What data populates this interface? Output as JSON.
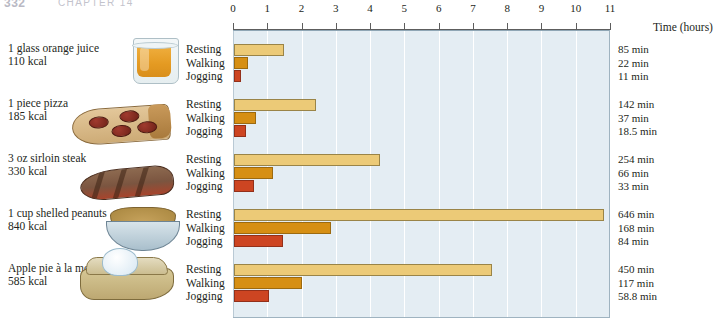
{
  "page_header": {
    "folio": "332",
    "running_head": "CHAPTER 14"
  },
  "chart_data": {
    "type": "bar",
    "orientation": "horizontal",
    "title": "",
    "xlabel": "Time (hours)",
    "ylabel": "",
    "xlim": [
      0,
      11
    ],
    "xticks": [
      0,
      1,
      2,
      3,
      4,
      5,
      6,
      7,
      8,
      9,
      10,
      11
    ],
    "xtick_labels": [
      "0",
      "1",
      "2",
      "3",
      "4",
      "5",
      "6",
      "7",
      "8",
      "9",
      "10",
      "11"
    ],
    "grid": true,
    "legend": "none",
    "value_unit": "min",
    "series": [
      {
        "name": "Resting",
        "color": "#ecca77",
        "values": [
          85,
          142,
          254,
          646,
          450
        ]
      },
      {
        "name": "Walking",
        "color": "#d68f14",
        "values": [
          22,
          37,
          66,
          168,
          117
        ]
      },
      {
        "name": "Jogging",
        "color": "#cd4522",
        "values": [
          11,
          18.5,
          33,
          84,
          58.8
        ]
      }
    ],
    "categories": [
      "1 glass orange juice",
      "1 piece pizza",
      "3 oz sirloin steak",
      "1 cup shelled peanuts",
      "Apple pie à la mode"
    ]
  },
  "axis": {
    "title": "Time (hours)",
    "ticks": [
      "0",
      "1",
      "2",
      "3",
      "4",
      "5",
      "6",
      "7",
      "8",
      "9",
      "10",
      "11"
    ]
  },
  "activities": [
    "Resting",
    "Walking",
    "Jogging"
  ],
  "rows": [
    {
      "food": "1 glass orange juice",
      "kcal": "110  kcal",
      "icon": "orange-juice-glass",
      "bars": [
        {
          "activity": "Resting",
          "minutes": 85,
          "label": "85 min",
          "hours": 1.4167
        },
        {
          "activity": "Walking",
          "minutes": 22,
          "label": "22 min",
          "hours": 0.3667
        },
        {
          "activity": "Jogging",
          "minutes": 11,
          "label": "11 min",
          "hours": 0.1833
        }
      ]
    },
    {
      "food": "1 piece pizza",
      "kcal": "185 kcal",
      "icon": "pizza-slice",
      "bars": [
        {
          "activity": "Resting",
          "minutes": 142,
          "label": "142 min",
          "hours": 2.3667
        },
        {
          "activity": "Walking",
          "minutes": 37,
          "label": "37 min",
          "hours": 0.6167
        },
        {
          "activity": "Jogging",
          "minutes": 18.5,
          "label": "18.5 min",
          "hours": 0.3083
        }
      ]
    },
    {
      "food": "3 oz sirloin steak",
      "kcal": "330 kcal",
      "icon": "steak",
      "bars": [
        {
          "activity": "Resting",
          "minutes": 254,
          "label": "254 min",
          "hours": 4.2333
        },
        {
          "activity": "Walking",
          "minutes": 66,
          "label": "66 min",
          "hours": 1.1
        },
        {
          "activity": "Jogging",
          "minutes": 33,
          "label": "33 min",
          "hours": 0.55
        }
      ]
    },
    {
      "food": "1 cup shelled peanuts",
      "kcal": "840 kcal",
      "icon": "peanut-bowl",
      "bars": [
        {
          "activity": "Resting",
          "minutes": 646,
          "label": "646 min",
          "hours": 10.7667
        },
        {
          "activity": "Walking",
          "minutes": 168,
          "label": "168 min",
          "hours": 2.8
        },
        {
          "activity": "Jogging",
          "minutes": 84,
          "label": "84 min",
          "hours": 1.4
        }
      ]
    },
    {
      "food": "Apple pie à la mode",
      "kcal": "585 kcal",
      "icon": "apple-pie-a-la-mode",
      "bars": [
        {
          "activity": "Resting",
          "minutes": 450,
          "label": "450 min",
          "hours": 7.5
        },
        {
          "activity": "Walking",
          "minutes": 117,
          "label": "117 min",
          "hours": 1.95
        },
        {
          "activity": "Jogging",
          "minutes": 58.8,
          "label": "58.8 min",
          "hours": 0.98
        }
      ]
    }
  ],
  "colors": {
    "resting": "#ecca77",
    "walking": "#d68f14",
    "jogging": "#cd4522",
    "plot_background": "#e4edf3",
    "gridline": "#ffffff",
    "plot_border": "#9fb3c0"
  }
}
